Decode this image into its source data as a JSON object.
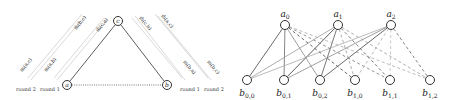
{
  "left_diagram": {
    "title": "message passing rounds on triangle",
    "nodes": [
      {
        "id": "c",
        "label": "c",
        "x": 118,
        "y": 21
      },
      {
        "id": "a",
        "label": "a",
        "x": 67,
        "y": 85
      },
      {
        "id": "b",
        "label": "b",
        "x": 167,
        "y": 85
      }
    ],
    "edges": [
      {
        "from": "c",
        "to": "a",
        "style": "solid"
      },
      {
        "from": "c",
        "to": "b",
        "style": "solid"
      },
      {
        "from": "a",
        "to": "b",
        "style": "dotted"
      }
    ],
    "messages": [
      {
        "label": "m̂(b,c)",
        "side": "left",
        "round": "round 2",
        "position": "top"
      },
      {
        "label": "m̃(c,a)",
        "side": "left",
        "round": "round 1",
        "position": "top"
      },
      {
        "label": "m(a,c)",
        "side": "left",
        "round": "round 2",
        "position": "bottom"
      },
      {
        "label": "m(a,b)",
        "side": "left",
        "round": "round 1",
        "position": "bottom"
      },
      {
        "label": "m̃(c,b)",
        "side": "right",
        "round": "round 1",
        "position": "top"
      },
      {
        "label": "m̂(a,c)",
        "side": "right",
        "round": "round 2",
        "position": "top"
      },
      {
        "label": "m(b,a)",
        "side": "right",
        "round": "round 1",
        "position": "bottom"
      },
      {
        "label": "m(b,c)",
        "side": "right",
        "round": "round 2",
        "position": "bottom"
      }
    ],
    "round_labels": [
      "round 2",
      "round 1",
      "round 1",
      "round 2"
    ]
  },
  "right_diagram": {
    "title": "bipartite graph",
    "top_nodes": [
      {
        "id": "a0",
        "base": "a",
        "sub": "0",
        "x": 285,
        "y": 25
      },
      {
        "id": "a1",
        "base": "a",
        "sub": "1",
        "x": 338,
        "y": 25
      },
      {
        "id": "a2",
        "base": "a",
        "sub": "2",
        "x": 391,
        "y": 25
      }
    ],
    "bottom_nodes": [
      {
        "id": "b00",
        "base": "b",
        "sub": "0,0",
        "x": 247,
        "y": 80
      },
      {
        "id": "b01",
        "base": "b",
        "sub": "0,1",
        "x": 284,
        "y": 80
      },
      {
        "id": "b02",
        "base": "b",
        "sub": "0,2",
        "x": 320,
        "y": 80
      },
      {
        "id": "b10",
        "base": "b",
        "sub": "1,0",
        "x": 355,
        "y": 80
      },
      {
        "id": "b11",
        "base": "b",
        "sub": "1,1",
        "x": 390,
        "y": 80
      },
      {
        "id": "b12",
        "base": "b",
        "sub": "1,2",
        "x": 430,
        "y": 80
      }
    ],
    "edges": [
      {
        "from": "a0",
        "to": "b00",
        "style": "solid",
        "color": "#444444"
      },
      {
        "from": "a0",
        "to": "b01",
        "style": "solid",
        "color": "#666666"
      },
      {
        "from": "a0",
        "to": "b02",
        "style": "solid",
        "color": "#888888"
      },
      {
        "from": "a1",
        "to": "b00",
        "style": "solid",
        "color": "#999999"
      },
      {
        "from": "a1",
        "to": "b01",
        "style": "solid",
        "color": "#333333"
      },
      {
        "from": "a1",
        "to": "b02",
        "style": "solid",
        "color": "#555555"
      },
      {
        "from": "a2",
        "to": "b00",
        "style": "solid",
        "color": "#aaaaaa"
      },
      {
        "from": "a2",
        "to": "b01",
        "style": "solid",
        "color": "#888888"
      },
      {
        "from": "a2",
        "to": "b02",
        "style": "solid",
        "color": "#444444"
      },
      {
        "from": "a0",
        "to": "b10",
        "style": "dashed",
        "color": "#444444"
      },
      {
        "from": "a0",
        "to": "b11",
        "style": "dashed",
        "color": "#777777"
      },
      {
        "from": "a0",
        "to": "b12",
        "style": "dashed",
        "color": "#aaaaaa"
      },
      {
        "from": "a1",
        "to": "b10",
        "style": "dashed",
        "color": "#999999"
      },
      {
        "from": "a1",
        "to": "b11",
        "style": "dashed",
        "color": "#555555"
      },
      {
        "from": "a1",
        "to": "b12",
        "style": "dashed",
        "color": "#999999"
      },
      {
        "from": "a2",
        "to": "b10",
        "style": "dashed",
        "color": "#aaaaaa"
      },
      {
        "from": "a2",
        "to": "b11",
        "style": "dashed",
        "color": "#bbbbbb"
      },
      {
        "from": "a2",
        "to": "b12",
        "style": "dashed",
        "color": "#666666"
      }
    ]
  }
}
